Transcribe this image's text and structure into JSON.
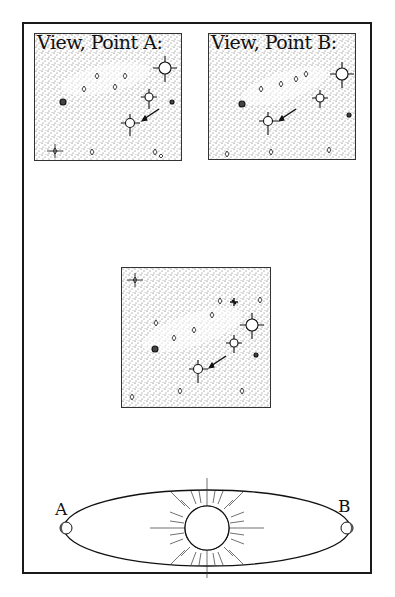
{
  "diagram": {
    "type": "parallax-illustration",
    "panels": [
      {
        "id": "a",
        "title": "View, Point A:",
        "content": "star field, arrowed star seen from point A"
      },
      {
        "id": "b",
        "title": "View, Point B:",
        "content": "star field, arrowed star shifted as seen from point B"
      },
      {
        "id": "c",
        "title": "",
        "content": "combined star field with arrowed star"
      }
    ],
    "orbit": {
      "label_a": "A",
      "label_b": "B",
      "center": "sun"
    },
    "colors": {
      "ink": "#111111",
      "stipple": "#555555",
      "paper": "#ffffff"
    }
  }
}
